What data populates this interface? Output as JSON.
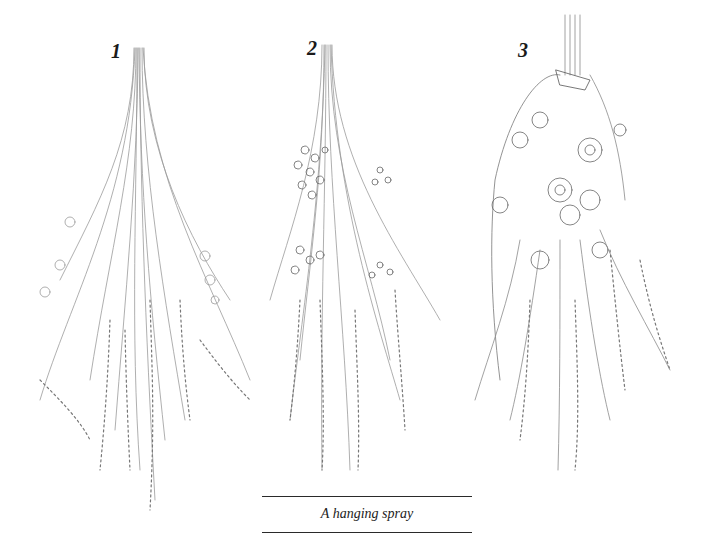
{
  "figure": {
    "caption": "A hanging spray",
    "panels": [
      {
        "number": "1",
        "description": "sparse spray of long stems with seed heads"
      },
      {
        "number": "2",
        "description": "spray with clustered small flowers"
      },
      {
        "number": "3",
        "description": "dense spray with large flowers tied at top"
      }
    ]
  },
  "colors": {
    "pencil": "#8a8a8a",
    "pencil_dark": "#555555",
    "text": "#1a1a1a",
    "background": "#ffffff"
  }
}
